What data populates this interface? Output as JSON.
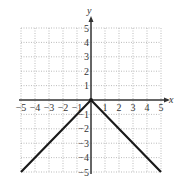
{
  "chart_data": {
    "type": "line",
    "title": "",
    "xlabel": "x",
    "ylabel": "y",
    "xlim": [
      -5,
      5
    ],
    "ylim": [
      -5,
      5
    ],
    "grid": true,
    "x_ticks": [
      -5,
      -4,
      -3,
      -2,
      -1,
      1,
      2,
      3,
      4,
      5
    ],
    "y_ticks": [
      5,
      4,
      3,
      2,
      1,
      -1,
      -2,
      -3,
      -4,
      -5
    ],
    "x_tick_labels": [
      "−5",
      "−4",
      "−3",
      "−2",
      "−1",
      "1",
      "2",
      "3",
      "4",
      "5"
    ],
    "y_tick_labels": [
      "5",
      "4",
      "3",
      "2",
      "1",
      "−1",
      "−2",
      "−3",
      "−4",
      "−5"
    ],
    "series": [
      {
        "name": "y = -|x|",
        "x": [
          -5,
          0,
          5
        ],
        "y": [
          -5,
          0,
          5
        ],
        "values": [
          -5,
          0,
          -5
        ]
      }
    ],
    "points": [
      [
        -5,
        -5
      ],
      [
        0,
        0
      ],
      [
        5,
        -5
      ]
    ],
    "origin_marker": true
  },
  "colors": {
    "axis": "#333333",
    "grid": "#aaaaaa",
    "line": "#1a1a1a"
  }
}
